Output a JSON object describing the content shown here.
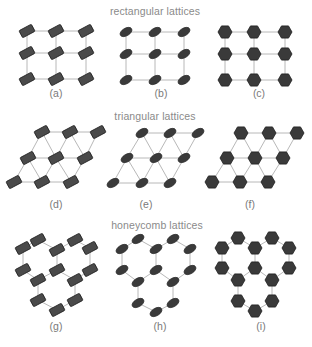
{
  "colors": {
    "edge": "#b8b8b8",
    "node_fill": "#3a3a3a",
    "node_stroke": "#1e1e1e",
    "rect_fill": "#4a4a4a",
    "title": "#8a8a8a",
    "label": "#7a7a7a"
  },
  "sections": [
    {
      "title": "rectangular lattices",
      "x": 155,
      "y": 5
    },
    {
      "title": "triangular lattices",
      "x": 155,
      "y": 110
    },
    {
      "title": "honeycomb lattices",
      "x": 157,
      "y": 219
    }
  ],
  "panels": [
    {
      "label": "(a)",
      "label_x": 56,
      "label_y": 87,
      "lattice": "rectangular",
      "shape": "rect",
      "nodes": [
        [
          27,
          31
        ],
        [
          56,
          31
        ],
        [
          86,
          31
        ],
        [
          27,
          53
        ],
        [
          56,
          53
        ],
        [
          86,
          53
        ],
        [
          27,
          79
        ],
        [
          56,
          79
        ],
        [
          86,
          79
        ]
      ],
      "edges": [
        [
          0,
          1
        ],
        [
          1,
          2
        ],
        [
          3,
          4
        ],
        [
          4,
          5
        ],
        [
          6,
          7
        ],
        [
          7,
          8
        ],
        [
          0,
          3
        ],
        [
          3,
          6
        ],
        [
          1,
          4
        ],
        [
          4,
          7
        ],
        [
          2,
          5
        ],
        [
          5,
          8
        ]
      ]
    },
    {
      "label": "(b)",
      "label_x": 161,
      "label_y": 87,
      "lattice": "rectangular",
      "shape": "ellipse",
      "nodes": [
        [
          126,
          32
        ],
        [
          155,
          32
        ],
        [
          184,
          32
        ],
        [
          126,
          54
        ],
        [
          155,
          54
        ],
        [
          184,
          54
        ],
        [
          126,
          80
        ],
        [
          155,
          80
        ],
        [
          184,
          80
        ]
      ],
      "edges": [
        [
          0,
          1
        ],
        [
          1,
          2
        ],
        [
          3,
          4
        ],
        [
          4,
          5
        ],
        [
          6,
          7
        ],
        [
          7,
          8
        ],
        [
          0,
          3
        ],
        [
          3,
          6
        ],
        [
          1,
          4
        ],
        [
          4,
          7
        ],
        [
          2,
          5
        ],
        [
          5,
          8
        ]
      ]
    },
    {
      "label": "(c)",
      "label_x": 259,
      "label_y": 87,
      "lattice": "rectangular",
      "shape": "hexagon",
      "nodes": [
        [
          225,
          32
        ],
        [
          254,
          32
        ],
        [
          285,
          32
        ],
        [
          225,
          54
        ],
        [
          254,
          54
        ],
        [
          285,
          54
        ],
        [
          225,
          80
        ],
        [
          254,
          80
        ],
        [
          285,
          80
        ]
      ],
      "edges": [
        [
          0,
          1
        ],
        [
          1,
          2
        ],
        [
          3,
          4
        ],
        [
          4,
          5
        ],
        [
          6,
          7
        ],
        [
          7,
          8
        ],
        [
          0,
          3
        ],
        [
          3,
          6
        ],
        [
          1,
          4
        ],
        [
          4,
          7
        ],
        [
          2,
          5
        ],
        [
          5,
          8
        ]
      ]
    },
    {
      "label": "(d)",
      "label_x": 56,
      "label_y": 198,
      "lattice": "triangular",
      "shape": "rect",
      "nodes": [
        [
          42,
          132
        ],
        [
          70,
          132
        ],
        [
          98,
          132
        ],
        [
          28,
          158
        ],
        [
          56,
          158
        ],
        [
          85,
          158
        ],
        [
          14,
          182
        ],
        [
          42,
          182
        ],
        [
          71,
          182
        ]
      ],
      "edges": [
        [
          0,
          1
        ],
        [
          1,
          2
        ],
        [
          3,
          4
        ],
        [
          4,
          5
        ],
        [
          6,
          7
        ],
        [
          7,
          8
        ],
        [
          0,
          3
        ],
        [
          0,
          4
        ],
        [
          1,
          4
        ],
        [
          1,
          5
        ],
        [
          2,
          5
        ],
        [
          3,
          6
        ],
        [
          3,
          7
        ],
        [
          4,
          7
        ],
        [
          4,
          8
        ],
        [
          5,
          8
        ]
      ]
    },
    {
      "label": "(e)",
      "label_x": 146,
      "label_y": 198,
      "lattice": "triangular",
      "shape": "ellipse",
      "nodes": [
        [
          142,
          133
        ],
        [
          170,
          133
        ],
        [
          198,
          133
        ],
        [
          127,
          158
        ],
        [
          156,
          158
        ],
        [
          184,
          158
        ],
        [
          113,
          183
        ],
        [
          142,
          183
        ],
        [
          170,
          183
        ]
      ],
      "edges": [
        [
          0,
          1
        ],
        [
          1,
          2
        ],
        [
          3,
          4
        ],
        [
          4,
          5
        ],
        [
          6,
          7
        ],
        [
          7,
          8
        ],
        [
          0,
          3
        ],
        [
          0,
          4
        ],
        [
          1,
          4
        ],
        [
          1,
          5
        ],
        [
          2,
          5
        ],
        [
          3,
          6
        ],
        [
          3,
          7
        ],
        [
          4,
          7
        ],
        [
          4,
          8
        ],
        [
          5,
          8
        ]
      ]
    },
    {
      "label": "(f)",
      "label_x": 250,
      "label_y": 198,
      "lattice": "triangular",
      "shape": "hexagon",
      "nodes": [
        [
          241,
          133
        ],
        [
          269,
          133
        ],
        [
          297,
          133
        ],
        [
          227,
          158
        ],
        [
          255,
          158
        ],
        [
          283,
          158
        ],
        [
          212,
          182
        ],
        [
          240,
          182
        ],
        [
          268,
          182
        ]
      ],
      "edges": [
        [
          0,
          1
        ],
        [
          1,
          2
        ],
        [
          3,
          4
        ],
        [
          4,
          5
        ],
        [
          6,
          7
        ],
        [
          7,
          8
        ],
        [
          0,
          3
        ],
        [
          0,
          4
        ],
        [
          1,
          4
        ],
        [
          1,
          5
        ],
        [
          2,
          5
        ],
        [
          3,
          6
        ],
        [
          3,
          7
        ],
        [
          4,
          7
        ],
        [
          4,
          8
        ],
        [
          5,
          8
        ]
      ]
    },
    {
      "label": "(g)",
      "label_x": 56,
      "label_y": 320,
      "lattice": "honeycomb",
      "shape": "rect",
      "nodes": [
        [
          23,
          248
        ],
        [
          38,
          240
        ],
        [
          57,
          250
        ],
        [
          75,
          240
        ],
        [
          90,
          248
        ],
        [
          23,
          270
        ],
        [
          57,
          270
        ],
        [
          90,
          270
        ],
        [
          38,
          280
        ],
        [
          75,
          280
        ],
        [
          38,
          300
        ],
        [
          75,
          300
        ],
        [
          57,
          310
        ]
      ],
      "edges": [
        [
          0,
          1
        ],
        [
          1,
          2
        ],
        [
          2,
          3
        ],
        [
          3,
          4
        ],
        [
          0,
          5
        ],
        [
          2,
          6
        ],
        [
          4,
          7
        ],
        [
          5,
          8
        ],
        [
          6,
          8
        ],
        [
          6,
          9
        ],
        [
          7,
          9
        ],
        [
          8,
          10
        ],
        [
          9,
          11
        ],
        [
          10,
          12
        ],
        [
          11,
          12
        ]
      ]
    },
    {
      "label": "(h)",
      "label_x": 160,
      "label_y": 320,
      "lattice": "honeycomb",
      "shape": "ellipse",
      "nodes": [
        [
          122,
          249
        ],
        [
          138,
          239
        ],
        [
          156,
          249
        ],
        [
          173,
          239
        ],
        [
          190,
          249
        ],
        [
          122,
          270
        ],
        [
          156,
          270
        ],
        [
          190,
          270
        ],
        [
          138,
          282
        ],
        [
          173,
          282
        ],
        [
          138,
          303
        ],
        [
          173,
          303
        ],
        [
          156,
          312
        ]
      ],
      "edges": [
        [
          0,
          1
        ],
        [
          1,
          2
        ],
        [
          2,
          3
        ],
        [
          3,
          4
        ],
        [
          0,
          5
        ],
        [
          2,
          6
        ],
        [
          4,
          7
        ],
        [
          5,
          8
        ],
        [
          6,
          8
        ],
        [
          6,
          9
        ],
        [
          7,
          9
        ],
        [
          8,
          10
        ],
        [
          9,
          11
        ],
        [
          10,
          12
        ],
        [
          11,
          12
        ]
      ]
    },
    {
      "label": "(i)",
      "label_x": 261,
      "label_y": 320,
      "lattice": "honeycomb",
      "shape": "hexagon",
      "nodes": [
        [
          222,
          248
        ],
        [
          238,
          238
        ],
        [
          255,
          248
        ],
        [
          272,
          238
        ],
        [
          289,
          248
        ],
        [
          222,
          268
        ],
        [
          255,
          268
        ],
        [
          289,
          268
        ],
        [
          238,
          280
        ],
        [
          272,
          280
        ],
        [
          238,
          301
        ],
        [
          272,
          301
        ],
        [
          255,
          311
        ]
      ],
      "edges": [
        [
          0,
          1
        ],
        [
          1,
          2
        ],
        [
          2,
          3
        ],
        [
          3,
          4
        ],
        [
          0,
          5
        ],
        [
          2,
          6
        ],
        [
          4,
          7
        ],
        [
          5,
          8
        ],
        [
          6,
          8
        ],
        [
          6,
          9
        ],
        [
          7,
          9
        ],
        [
          8,
          10
        ],
        [
          9,
          11
        ],
        [
          10,
          12
        ],
        [
          11,
          12
        ]
      ]
    }
  ]
}
